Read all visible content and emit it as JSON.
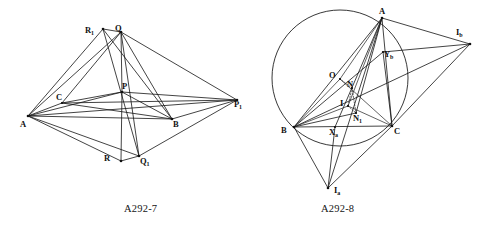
{
  "page": {
    "background_color": "#ffffff",
    "ink_color": "#141414",
    "width": 492,
    "height": 227
  },
  "figures": [
    {
      "id": "figure-left",
      "caption": "A292-7",
      "caption_pos": {
        "x": 150,
        "y": 203
      },
      "type": "line-diagram",
      "points": [
        {
          "name": "A",
          "label": "A",
          "x": 28,
          "y": 116,
          "label_x": 20,
          "label_y": 120,
          "dot": true
        },
        {
          "name": "C",
          "label": "C",
          "x": 62,
          "y": 103,
          "label_x": 56,
          "label_y": 93,
          "dot": true
        },
        {
          "name": "R1",
          "label": "R",
          "sub": "1",
          "x": 103,
          "y": 29,
          "label_x": 85,
          "label_y": 26,
          "dot": true
        },
        {
          "name": "Q",
          "label": "Q",
          "x": 121,
          "y": 32,
          "label_x": 115,
          "label_y": 24,
          "dot": true
        },
        {
          "name": "P",
          "label": "P",
          "x": 122,
          "y": 92,
          "label_x": 122,
          "label_y": 82,
          "dot": true
        },
        {
          "name": "B",
          "label": "B",
          "x": 172,
          "y": 119,
          "label_x": 173,
          "label_y": 120,
          "dot": true
        },
        {
          "name": "P1",
          "label": "P",
          "sub": "1",
          "x": 237,
          "y": 100,
          "label_x": 234,
          "label_y": 100,
          "dot": true
        },
        {
          "name": "R",
          "label": "R",
          "x": 121,
          "y": 161,
          "label_x": 104,
          "label_y": 154,
          "dot": true
        },
        {
          "name": "Q1",
          "label": "Q",
          "sub": "1",
          "x": 139,
          "y": 156,
          "label_x": 140,
          "label_y": 157,
          "dot": true
        }
      ],
      "segments": [
        [
          "A",
          "R1"
        ],
        [
          "A",
          "Q"
        ],
        [
          "A",
          "C"
        ],
        [
          "A",
          "P"
        ],
        [
          "A",
          "B"
        ],
        [
          "A",
          "P1"
        ],
        [
          "A",
          "R"
        ],
        [
          "A",
          "Q1"
        ],
        [
          "C",
          "Q"
        ],
        [
          "C",
          "P1"
        ],
        [
          "C",
          "B"
        ],
        [
          "R1",
          "Q"
        ],
        [
          "R1",
          "B"
        ],
        [
          "Q",
          "P"
        ],
        [
          "Q",
          "P1"
        ],
        [
          "Q",
          "B"
        ],
        [
          "Q",
          "Q1"
        ],
        [
          "R1",
          "Q1"
        ],
        [
          "P",
          "B"
        ],
        [
          "P",
          "P1"
        ],
        [
          "P",
          "R"
        ],
        [
          "B",
          "P1"
        ],
        [
          "R",
          "Q1"
        ],
        [
          "Q1",
          "P1"
        ],
        [
          "C",
          "P"
        ]
      ]
    },
    {
      "id": "figure-right",
      "caption": "A292-8",
      "caption_pos": {
        "x": 347,
        "y": 203
      },
      "type": "line-diagram-with-circle",
      "circle": {
        "cx": 340,
        "cy": 78,
        "r": 68
      },
      "points": [
        {
          "name": "A",
          "label": "A",
          "x": 382,
          "y": 18,
          "label_x": 379,
          "label_y": 7,
          "dot": true
        },
        {
          "name": "B",
          "label": "B",
          "x": 294,
          "y": 127,
          "label_x": 281,
          "label_y": 126,
          "dot": true
        },
        {
          "name": "C",
          "label": "C",
          "x": 392,
          "y": 126,
          "label_x": 394,
          "label_y": 127,
          "dot": true
        },
        {
          "name": "O",
          "label": "O",
          "x": 340,
          "y": 79,
          "label_x": 329,
          "label_y": 71,
          "dot": true
        },
        {
          "name": "N",
          "label": "N",
          "x": 352,
          "y": 88,
          "label_x": 347,
          "label_y": 80,
          "dot": true
        },
        {
          "name": "I",
          "label": "I",
          "x": 348,
          "y": 106,
          "label_x": 340,
          "label_y": 99,
          "dot": true
        },
        {
          "name": "N1",
          "label": "N",
          "sub": "1",
          "x": 356,
          "y": 113,
          "label_x": 353,
          "label_y": 114,
          "dot": true
        },
        {
          "name": "Xa",
          "label": "X",
          "sub": "a",
          "x": 335,
          "y": 127,
          "label_x": 329,
          "label_y": 128,
          "dot": true
        },
        {
          "name": "Yb",
          "label": "Y",
          "sub": "b",
          "x": 383,
          "y": 52,
          "label_x": 384,
          "label_y": 50,
          "dot": true
        },
        {
          "name": "Ia",
          "label": "I",
          "sub": "a",
          "x": 328,
          "y": 188,
          "label_x": 334,
          "label_y": 186,
          "dot": true
        },
        {
          "name": "Ib",
          "label": "I",
          "sub": "b",
          "x": 470,
          "y": 44,
          "label_x": 456,
          "label_y": 28,
          "dot": true
        }
      ],
      "segments": [
        [
          "A",
          "B"
        ],
        [
          "B",
          "C"
        ],
        [
          "C",
          "A"
        ],
        [
          "A",
          "Ia"
        ],
        [
          "B",
          "Ib"
        ],
        [
          "C",
          "Ib"
        ],
        [
          "A",
          "Ib"
        ],
        [
          "B",
          "Ia"
        ],
        [
          "C",
          "Ia"
        ],
        [
          "Xa",
          "Ia"
        ],
        [
          "A",
          "Xa"
        ],
        [
          "B",
          "Yb"
        ],
        [
          "A",
          "N1"
        ],
        [
          "B",
          "N1"
        ],
        [
          "O",
          "B"
        ],
        [
          "O",
          "C"
        ],
        [
          "O",
          "A"
        ],
        [
          "B",
          "I"
        ],
        [
          "C",
          "I"
        ],
        [
          "A",
          "I"
        ],
        [
          "Yb",
          "C"
        ],
        [
          "Yb",
          "Ib"
        ],
        [
          "A",
          "Yb"
        ]
      ],
      "dotted_segments": [
        [
          "O",
          "N"
        ],
        [
          "N",
          "I"
        ],
        [
          "I",
          "N1"
        ],
        [
          "N",
          "N1"
        ]
      ]
    }
  ]
}
